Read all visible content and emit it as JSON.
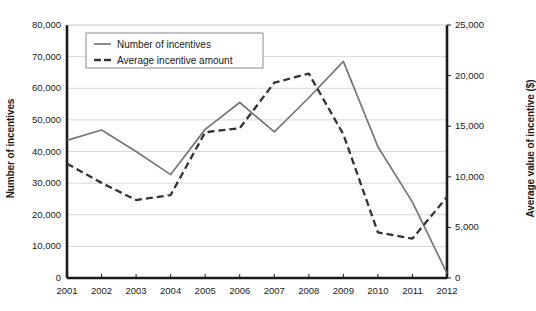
{
  "chart_data": {
    "type": "line",
    "title": "",
    "xlabel": "",
    "ylabel": "Number of incentives",
    "y2label": "Average value of incentive ($)",
    "grid": true,
    "legend_position": "top-left",
    "categories": [
      "2001",
      "2002",
      "2003",
      "2004",
      "2005",
      "2006",
      "2007",
      "2008",
      "2009",
      "2010",
      "2011",
      "2012"
    ],
    "ylim": [
      0,
      80000
    ],
    "y2lim": [
      0,
      25000
    ],
    "yticks": [
      "0",
      "10,000",
      "20,000",
      "30,000",
      "40,000",
      "50,000",
      "60,000",
      "70,000",
      "80,000"
    ],
    "ytick_values": [
      0,
      10000,
      20000,
      30000,
      40000,
      50000,
      60000,
      70000,
      80000
    ],
    "y2ticks": [
      "0",
      "5,000",
      "10,000",
      "15,000",
      "20,000",
      "25,000"
    ],
    "y2tick_values": [
      0,
      5000,
      10000,
      15000,
      20000,
      25000
    ],
    "series": [
      {
        "name": "Number of incentives",
        "axis": "left",
        "style": "solid",
        "color": "#767676",
        "values": [
          43500,
          46800,
          40000,
          32700,
          47000,
          55500,
          46200,
          57000,
          68500,
          41500,
          24000,
          1500
        ]
      },
      {
        "name": "Average incentive amount",
        "axis": "right",
        "style": "dashed",
        "color": "#333333",
        "values": [
          11300,
          9400,
          7700,
          8200,
          14400,
          14800,
          19300,
          20200,
          14200,
          4500,
          3900,
          8000
        ]
      }
    ],
    "legend": [
      {
        "label": "Number of incentives",
        "style": "solid",
        "color": "#767676"
      },
      {
        "label": "Average incentive amount",
        "style": "dashed",
        "color": "#333333"
      }
    ],
    "colors": {
      "axis": "#1a1a1a",
      "grid": "#d8d8d8",
      "background": "#ffffff",
      "series_solid": "#767676",
      "series_dashed": "#333333"
    }
  }
}
